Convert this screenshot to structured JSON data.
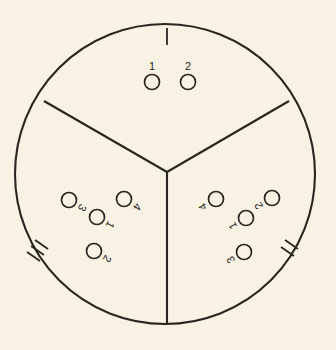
{
  "figure": {
    "background_color": "#f7f2e4",
    "ink_color": "#2a2520",
    "canvas": {
      "width": 336,
      "height": 350
    }
  },
  "boundary": {
    "name": "outer-circle",
    "center_x": 165,
    "center_y": 174,
    "radius": 150
  },
  "dividers": [
    {
      "name": "divider-vertical-bottom",
      "x1": 167,
      "y1": 172,
      "x2": 167,
      "y2": 324
    },
    {
      "name": "divider-upper-left",
      "x1": 167,
      "y1": 172,
      "x2": 44,
      "y2": 101
    },
    {
      "name": "divider-upper-right",
      "x1": 167,
      "y1": 172,
      "x2": 289,
      "y2": 101
    }
  ],
  "sectors": [
    {
      "name": "top-sector",
      "tick_count": 1,
      "tick_label": "I",
      "node_count": 2,
      "label_rotation": 0,
      "nodes": [
        {
          "label": "1",
          "cx": 152,
          "cy": 82,
          "r": 7.5
        },
        {
          "label": "2",
          "cx": 188,
          "cy": 82,
          "r": 7.5
        }
      ],
      "ticks": [
        {
          "x1": 167,
          "y1": 28,
          "x2": 167,
          "y2": 45
        }
      ]
    },
    {
      "name": "lower-left-sector",
      "tick_count": 3,
      "tick_label": "III",
      "node_count": 4,
      "label_rotation": 120,
      "nodes": [
        {
          "label": "3",
          "cx": 69,
          "cy": 200,
          "r": 7.5
        },
        {
          "label": "4",
          "cx": 124,
          "cy": 199,
          "r": 7.5
        },
        {
          "label": "1",
          "cx": 97,
          "cy": 217,
          "r": 7.5
        },
        {
          "label": "2",
          "cx": 94,
          "cy": 251,
          "r": 7.5
        }
      ],
      "ticks": [
        {
          "x1": 35,
          "y1": 240,
          "x2": 48,
          "y2": 249
        },
        {
          "x1": 31,
          "y1": 246,
          "x2": 44,
          "y2": 255
        },
        {
          "x1": 27,
          "y1": 252,
          "x2": 40,
          "y2": 261
        }
      ]
    },
    {
      "name": "lower-right-sector",
      "tick_count": 2,
      "tick_label": "II",
      "node_count": 4,
      "label_rotation": 240,
      "nodes": [
        {
          "label": "4",
          "cx": 216,
          "cy": 199,
          "r": 7.5
        },
        {
          "label": "2",
          "cx": 272,
          "cy": 198,
          "r": 7.5
        },
        {
          "label": "1",
          "cx": 246,
          "cy": 218,
          "r": 7.5
        },
        {
          "label": "3",
          "cx": 244,
          "cy": 252,
          "r": 7.5
        }
      ],
      "ticks": [
        {
          "x1": 285,
          "y1": 240,
          "x2": 298,
          "y2": 249
        },
        {
          "x1": 281,
          "y1": 247,
          "x2": 294,
          "y2": 256
        }
      ]
    }
  ]
}
